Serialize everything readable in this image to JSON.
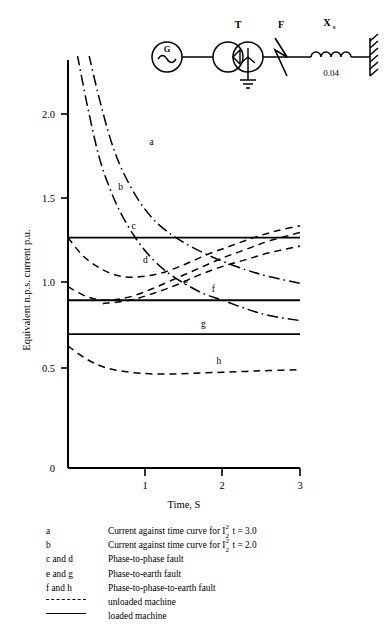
{
  "chart_data": {
    "type": "line",
    "title": "",
    "xlabel": "Time, S",
    "ylabel": "Equivalent n.p.s. current p.u.",
    "xlim": [
      0,
      3
    ],
    "ylim": [
      0,
      2.25
    ],
    "xticks": [
      "0",
      "1",
      "2",
      "3"
    ],
    "xtick_values": [
      0,
      1,
      2,
      3
    ],
    "yticks": [
      "0.5",
      "1.0",
      "1.5",
      "2.0"
    ],
    "ytick_values": [
      0.5,
      1.0,
      1.5,
      2.0
    ],
    "grid": false,
    "legend_position": "below",
    "series": [
      {
        "name": "a",
        "label": "a",
        "style": "dash-dot",
        "description": "Current against time curve for I2^2 t = 3.0",
        "points": [
          [
            0.27,
            2.35
          ],
          [
            0.4,
            2.1
          ],
          [
            0.55,
            1.85
          ],
          [
            0.7,
            1.67
          ],
          [
            0.9,
            1.5
          ],
          [
            1.1,
            1.38
          ],
          [
            1.3,
            1.3
          ],
          [
            1.5,
            1.24
          ],
          [
            1.75,
            1.18
          ],
          [
            2.0,
            1.13
          ],
          [
            2.3,
            1.08
          ],
          [
            2.6,
            1.04
          ],
          [
            3.0,
            1.0
          ]
        ]
      },
      {
        "name": "b",
        "label": "b",
        "style": "dash-dot",
        "description": "Current against time curve for I2^2 t = 2.0",
        "points": [
          [
            0.12,
            2.35
          ],
          [
            0.25,
            2.05
          ],
          [
            0.4,
            1.75
          ],
          [
            0.55,
            1.55
          ],
          [
            0.7,
            1.4
          ],
          [
            0.9,
            1.25
          ],
          [
            1.1,
            1.14
          ],
          [
            1.3,
            1.06
          ],
          [
            1.5,
            1.0
          ],
          [
            1.75,
            0.94
          ],
          [
            2.0,
            0.9
          ],
          [
            2.3,
            0.85
          ],
          [
            2.6,
            0.81
          ],
          [
            3.0,
            0.78
          ]
        ]
      },
      {
        "name": "c",
        "label": "c",
        "style": "solid",
        "description": "Phase-to-phase fault, loaded machine",
        "points": [
          [
            0,
            1.27
          ],
          [
            3,
            1.27
          ]
        ]
      },
      {
        "name": "d",
        "label": "d",
        "style": "dashed",
        "description": "Phase-to-phase fault, unloaded machine",
        "points": [
          [
            0,
            1.27
          ],
          [
            0.2,
            1.16
          ],
          [
            0.45,
            1.08
          ],
          [
            0.7,
            1.04
          ],
          [
            0.95,
            1.04
          ],
          [
            1.2,
            1.06
          ],
          [
            1.5,
            1.11
          ],
          [
            1.8,
            1.17
          ],
          [
            2.1,
            1.22
          ],
          [
            2.4,
            1.27
          ],
          [
            2.7,
            1.31
          ],
          [
            3.0,
            1.34
          ]
        ]
      },
      {
        "name": "e",
        "label": "e",
        "style": "dashed",
        "description": "Phase-to-earth fault, unloaded machine",
        "points": [
          [
            0,
            0.98
          ],
          [
            0.25,
            0.92
          ],
          [
            0.5,
            0.9
          ],
          [
            0.8,
            0.92
          ],
          [
            1.1,
            0.97
          ],
          [
            1.4,
            1.03
          ],
          [
            1.7,
            1.09
          ],
          [
            2.0,
            1.15
          ],
          [
            2.3,
            1.2
          ],
          [
            2.6,
            1.25
          ],
          [
            3.0,
            1.3
          ]
        ]
      },
      {
        "name": "f",
        "label": "f",
        "style": "solid",
        "description": "Phase-to-phase-to-earth fault, loaded machine",
        "points": [
          [
            0,
            0.9
          ],
          [
            3,
            0.9
          ]
        ]
      },
      {
        "name": "f2",
        "label": "",
        "style": "dashed",
        "description": "Phase-to-phase-to-earth fault, unloaded machine rising curve",
        "points": [
          [
            0.45,
            0.88
          ],
          [
            0.8,
            0.9
          ],
          [
            1.1,
            0.94
          ],
          [
            1.4,
            0.99
          ],
          [
            1.7,
            1.05
          ],
          [
            2.0,
            1.1
          ],
          [
            2.3,
            1.14
          ],
          [
            2.6,
            1.18
          ],
          [
            3.0,
            1.22
          ]
        ]
      },
      {
        "name": "g",
        "label": "g",
        "style": "solid",
        "description": "Phase-to-earth fault, loaded machine",
        "points": [
          [
            0,
            0.7
          ],
          [
            3,
            0.7
          ]
        ]
      },
      {
        "name": "h",
        "label": "h",
        "style": "dashed",
        "description": "Phase-to-phase-to-earth fault, unloaded machine lower curve",
        "points": [
          [
            0,
            0.63
          ],
          [
            0.25,
            0.55
          ],
          [
            0.5,
            0.5
          ],
          [
            0.8,
            0.475
          ],
          [
            1.1,
            0.465
          ],
          [
            1.4,
            0.465
          ],
          [
            1.7,
            0.47
          ],
          [
            2.0,
            0.475
          ],
          [
            2.3,
            0.48
          ],
          [
            2.6,
            0.485
          ],
          [
            3.0,
            0.49
          ]
        ]
      }
    ],
    "curve_labels": [
      {
        "text": "a",
        "x": 1.08,
        "y": 1.82
      },
      {
        "text": "b",
        "x": 0.68,
        "y": 1.55
      },
      {
        "text": "c",
        "x": 0.85,
        "y": 1.32
      },
      {
        "text": "d",
        "x": 1.0,
        "y": 1.12
      },
      {
        "text": "e",
        "x": 1.52,
        "y": 0.99
      },
      {
        "text": "f",
        "x": 1.88,
        "y": 0.95
      },
      {
        "text": "g",
        "x": 1.75,
        "y": 0.745
      },
      {
        "text": "h",
        "x": 1.95,
        "y": 0.525
      }
    ]
  },
  "circuit": {
    "generator_label": "G",
    "transformer_label": "T",
    "fault_label": "F",
    "reactance_label": "X",
    "reactance_subscript": "s",
    "reactance_value": "0.04"
  },
  "legend": {
    "rows": [
      {
        "key": "a",
        "desc_prefix": "Current against time curve for I",
        "has_frac": true,
        "frac_up": "2",
        "frac_dn": "2",
        "desc_suffix": "t = 3.0",
        "swatch": null
      },
      {
        "key": "b",
        "desc_prefix": "Current against time curve for I",
        "has_frac": true,
        "frac_up": "2",
        "frac_dn": "2",
        "desc_suffix": "t = 2.0",
        "swatch": null
      },
      {
        "key": "c and d",
        "desc_prefix": "Phase-to-phase fault",
        "has_frac": false,
        "frac_up": "",
        "frac_dn": "",
        "desc_suffix": "",
        "swatch": null
      },
      {
        "key": "e and g",
        "desc_prefix": "Phase-to-earth fault",
        "has_frac": false,
        "frac_up": "",
        "frac_dn": "",
        "desc_suffix": "",
        "swatch": null
      },
      {
        "key": "f and h",
        "desc_prefix": "Phase-to-phase-to-earth fault",
        "has_frac": false,
        "frac_up": "",
        "frac_dn": "",
        "desc_suffix": "",
        "swatch": null
      },
      {
        "key": "",
        "desc_prefix": "unloaded machine",
        "has_frac": false,
        "frac_up": "",
        "frac_dn": "",
        "desc_suffix": "",
        "swatch": "dashed"
      },
      {
        "key": "",
        "desc_prefix": "loaded machine",
        "has_frac": false,
        "frac_up": "",
        "frac_dn": "",
        "desc_suffix": "",
        "swatch": "solid"
      }
    ]
  },
  "colors": {
    "ink": "#000000",
    "background": "#ffffff"
  }
}
